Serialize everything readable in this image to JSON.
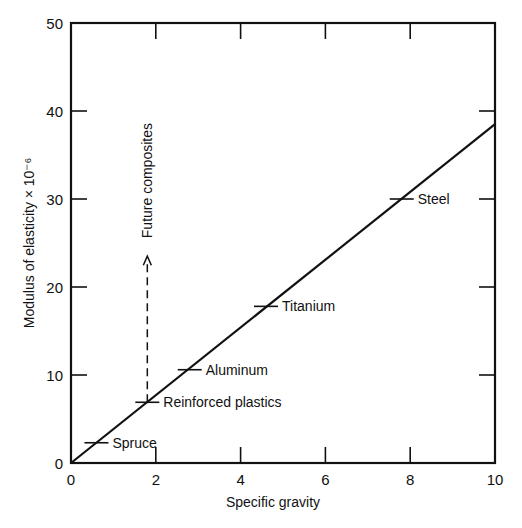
{
  "chart_data": {
    "type": "line",
    "title": "",
    "xlabel": "Specific gravity",
    "ylabel": "Modulus of elasticity × 10⁻⁶",
    "xlim": [
      0,
      10
    ],
    "ylim": [
      0,
      50
    ],
    "xticks": [
      0,
      2,
      4,
      6,
      8,
      10
    ],
    "yticks": [
      0,
      10,
      20,
      30,
      40,
      50
    ],
    "grid": false,
    "legend": null,
    "series": [
      {
        "name": "Specific modulus line",
        "x": [
          0,
          10
        ],
        "y": [
          0,
          38.5
        ]
      }
    ],
    "points": [
      {
        "label": "Spruce",
        "x": 0.6,
        "y": 2.3
      },
      {
        "label": "Reinforced plastics",
        "x": 1.8,
        "y": 6.9
      },
      {
        "label": "Aluminum",
        "x": 2.8,
        "y": 10.6
      },
      {
        "label": "Titanium",
        "x": 4.6,
        "y": 17.8
      },
      {
        "label": "Steel",
        "x": 7.8,
        "y": 30.0
      }
    ],
    "annotations": [
      {
        "type": "dashed-arrow",
        "text": "Future composites",
        "from": [
          1.8,
          6.9
        ],
        "to": [
          1.8,
          23.5
        ]
      }
    ]
  }
}
